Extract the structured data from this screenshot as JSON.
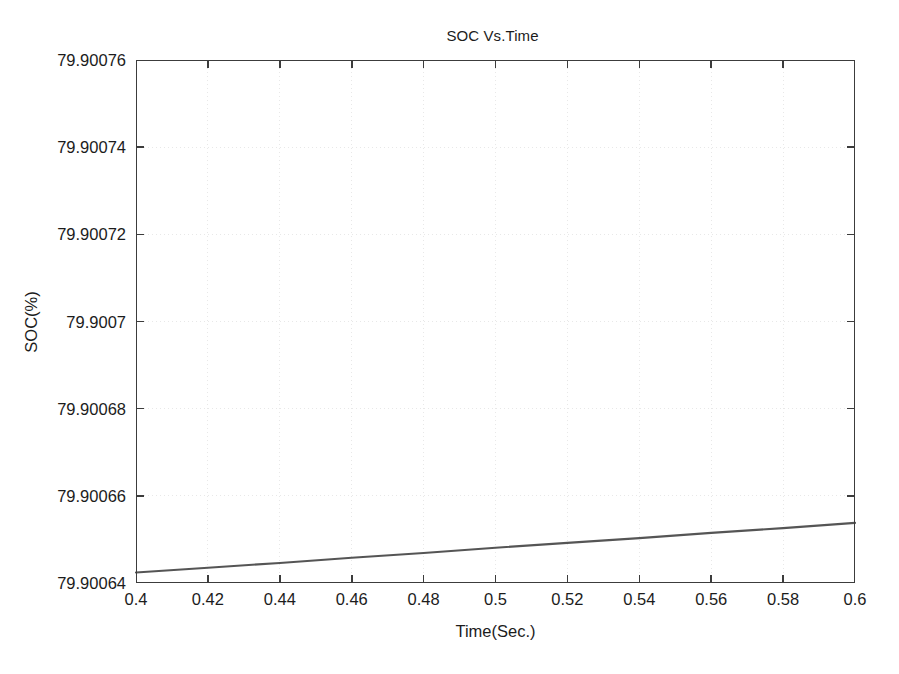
{
  "figure": {
    "background_color": "#ffffff",
    "axes_color": "#3c3c3c",
    "grid_color": "#e8e8e8",
    "line_color": "#555555"
  },
  "chart_data": {
    "type": "line",
    "title": "SOC Vs.Time",
    "xlabel": "Time(Sec.)",
    "ylabel": "SOC(%)",
    "xlim": [
      0.4,
      0.6
    ],
    "ylim": [
      79.90064,
      79.90076
    ],
    "grid": true,
    "grid_style": "dotted",
    "legend": null,
    "xticks": [
      0.4,
      0.42,
      0.44,
      0.46,
      0.48,
      0.5,
      0.52,
      0.54,
      0.56,
      0.58,
      0.6
    ],
    "xtick_labels": [
      "0.4",
      "0.42",
      "0.44",
      "0.46",
      "0.48",
      "0.5",
      "0.52",
      "0.54",
      "0.56",
      "0.58",
      "0.6"
    ],
    "yticks": [
      79.90064,
      79.90066,
      79.90068,
      79.9007,
      79.90072,
      79.90074,
      79.90076
    ],
    "ytick_labels": [
      "79.90064",
      "79.90066",
      "79.90068",
      "79.9007",
      "79.90072",
      "79.90074",
      "79.90076"
    ],
    "series": [
      {
        "name": "SOC",
        "x": [
          0.4,
          0.42,
          0.44,
          0.46,
          0.48,
          0.5,
          0.52,
          0.54,
          0.56,
          0.58,
          0.6
        ],
        "values": [
          79.9006424,
          79.9006435,
          79.9006446,
          79.9006458,
          79.9006469,
          79.9006481,
          79.9006492,
          79.9006503,
          79.9006515,
          79.9006526,
          79.9006538
        ]
      }
    ]
  }
}
